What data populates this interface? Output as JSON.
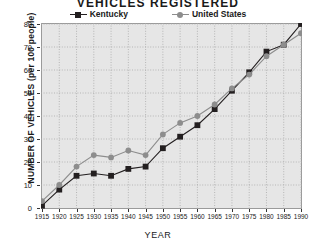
{
  "chart_data": {
    "type": "line",
    "title": "VEHICLES  REGISTERED",
    "xlabel": "YEAR",
    "ylabel": "NUMBER OF VEHICLES (per 100 people)",
    "categories": [
      1915,
      1920,
      1925,
      1930,
      1935,
      1940,
      1945,
      1950,
      1955,
      1960,
      1965,
      1970,
      1975,
      1980,
      1985,
      1990
    ],
    "xlim": [
      1915,
      1990
    ],
    "ylim": [
      0,
      80
    ],
    "yticks": [
      0,
      10,
      20,
      30,
      40,
      50,
      60,
      70,
      80
    ],
    "xticks": [
      1915,
      1920,
      1925,
      1930,
      1935,
      1940,
      1945,
      1950,
      1955,
      1960,
      1965,
      1970,
      1975,
      1980,
      1985,
      1990
    ],
    "grid": true,
    "legend_position": "top-center",
    "series": [
      {
        "name": "Kentucky",
        "color": "#231f20",
        "marker": "square",
        "values": [
          1,
          8,
          14,
          15,
          14,
          17,
          18,
          26,
          31,
          36,
          43,
          51,
          59,
          68,
          71,
          80
        ]
      },
      {
        "name": "United States",
        "color": "#8d8d8d",
        "marker": "circle",
        "values": [
          3,
          10,
          18,
          23,
          22,
          25,
          23,
          32,
          37,
          40,
          45,
          52,
          58,
          66,
          71,
          76
        ]
      }
    ]
  },
  "axis": {
    "ytick_labels": [
      "0",
      "10",
      "20",
      "30",
      "40",
      "50",
      "60",
      "70",
      "80"
    ],
    "xtick_labels": [
      "1915",
      "1920",
      "1925",
      "1930",
      "1935",
      "1940",
      "1945",
      "1950",
      "1955",
      "1960",
      "1965",
      "1970",
      "1975",
      "1980",
      "1985",
      "1990"
    ]
  },
  "style": {
    "plot_background": "#e6e6e6",
    "plot_border": "#9a9a9a",
    "grid_color": "#a9a9a9",
    "page_background": "#ffffff",
    "text_color": "#1a1a1a"
  }
}
